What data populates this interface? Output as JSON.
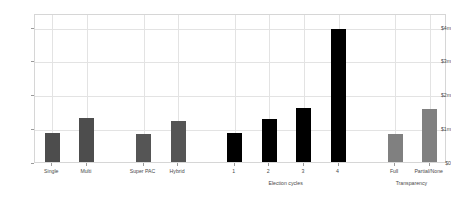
{
  "chart_data": {
    "type": "bar",
    "title": "",
    "subtitle": "",
    "xlabel": "",
    "ylabel": "",
    "ylim": [
      0,
      4400000
    ],
    "grid": true,
    "legend_position": "none",
    "y_ticks": [
      {
        "value": 0,
        "label": "$0"
      },
      {
        "value": 1000000,
        "label": "$1m"
      },
      {
        "value": 2000000,
        "label": "$2m"
      },
      {
        "value": 3000000,
        "label": "$3m"
      },
      {
        "value": 4000000,
        "label": "$4m"
      }
    ],
    "groups": [
      {
        "name": "candidate-committee-type",
        "axis_title": "",
        "color": "#4d4d4d",
        "categories": [
          "Single",
          "Multi"
        ],
        "values": [
          850000,
          1300000
        ]
      },
      {
        "name": "pac-type",
        "axis_title": "",
        "color": "#555555",
        "categories": [
          "Super PAC",
          "Hybrid"
        ],
        "values": [
          830000,
          1210000
        ]
      },
      {
        "name": "election-cycles",
        "axis_title": "Election cycles",
        "color": "#000000",
        "categories": [
          "1",
          "2",
          "3",
          "4"
        ],
        "values": [
          860000,
          1260000,
          1590000,
          3940000
        ]
      },
      {
        "name": "transparency",
        "axis_title": "Transparency",
        "color": "#808080",
        "categories": [
          "Full",
          "Partial/None"
        ],
        "values": [
          830000,
          1580000
        ]
      }
    ]
  },
  "style": {
    "background": "#ffffff",
    "gridline_color": "#e3e3e3",
    "frame_color": "#d6d6d6",
    "tick_color": "#9a9a9a",
    "text_color": "#4a4a4a"
  }
}
